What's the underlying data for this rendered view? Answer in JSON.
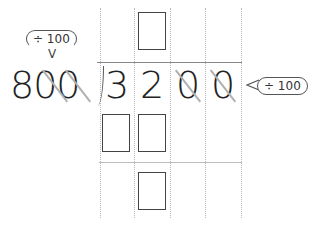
{
  "problem": {
    "divisor": "800",
    "dividend_digits": [
      "3",
      "2",
      "0",
      "0"
    ],
    "struck_dividend_indices": [
      2,
      3
    ],
    "struck_divisor_zeros": 2
  },
  "annotations": {
    "divisor_hint": "÷ 100",
    "divisor_arrow": "V",
    "dividend_hint": "÷ 100"
  },
  "answer_boxes": {
    "quotient_row": 1,
    "product_row": 2,
    "remainder_row": 1
  },
  "colors": {
    "digit": "#222222",
    "strike": "#b0b0b0",
    "grid": "#b8b8b8",
    "box_border": "#444444"
  }
}
